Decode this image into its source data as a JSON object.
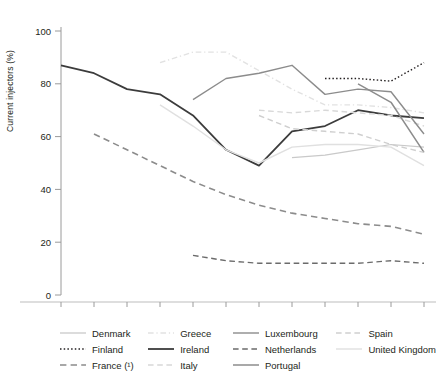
{
  "chart_data": {
    "type": "line",
    "title": "",
    "xlabel": "",
    "ylabel": "Current injectors (%)",
    "x": [
      1990,
      1991,
      1992,
      1993,
      1994,
      1995,
      1996,
      1997,
      1998,
      1999,
      2000,
      2001
    ],
    "xticklabels": [
      "1990",
      "1991",
      "1992",
      "1993",
      "1994",
      "1995",
      "1996",
      "1997",
      "1998",
      "1999",
      "2000",
      "2001"
    ],
    "yticks": [
      0,
      20,
      40,
      60,
      80,
      100
    ],
    "yticklabels": [
      "0",
      "20",
      "40",
      "60",
      "80",
      "100"
    ],
    "ylim": [
      0,
      100
    ],
    "xlim": [
      1990,
      2001
    ],
    "grid": false,
    "legend_position": "bottom",
    "series": [
      {
        "name": "Denmark",
        "color": "#c9c9c9",
        "dash": "solid",
        "width": 1.2,
        "x": [
          1997,
          1998,
          1999,
          2000,
          2001
        ],
        "values": [
          52,
          53,
          55,
          57,
          56
        ]
      },
      {
        "name": "Finland",
        "color": "#231f20",
        "dash": "dotted",
        "width": 1.4,
        "x": [
          1998,
          1999,
          2000,
          2001
        ],
        "values": [
          82,
          82,
          81,
          88
        ]
      },
      {
        "name": "France (¹)",
        "color": "#8c8c8c",
        "dash": "dashed",
        "width": 1.6,
        "x": [
          1991,
          1992,
          1993,
          1994,
          1995,
          1996,
          1997,
          1998,
          1999,
          2000,
          2001
        ],
        "values": [
          61,
          55,
          49,
          43,
          38,
          34,
          31,
          29,
          27,
          26,
          23
        ]
      },
      {
        "name": "Greece",
        "color": "#e2e2e2",
        "dash": "dashdot",
        "width": 1.4,
        "x": [
          1993,
          1994,
          1995,
          1996,
          1997,
          1998,
          1999,
          2000,
          2001
        ],
        "values": [
          88,
          92,
          92,
          85,
          78,
          72,
          72,
          71,
          69
        ]
      },
      {
        "name": "Ireland",
        "color": "#3c3c3c",
        "dash": "solid",
        "width": 1.8,
        "x": [
          1990,
          1991,
          1992,
          1993,
          1994,
          1995,
          1996,
          1997,
          1998,
          1999,
          2000,
          2001
        ],
        "values": [
          87,
          84,
          78,
          76,
          68,
          55,
          49,
          62,
          64,
          70,
          68,
          67
        ]
      },
      {
        "name": "Italy",
        "color": "#d8d8d8",
        "dash": "dashed",
        "width": 1.4,
        "x": [
          1996,
          1997,
          1998,
          1999,
          2000,
          2001
        ],
        "values": [
          70,
          69,
          70,
          69,
          68,
          64
        ]
      },
      {
        "name": "Luxembourg",
        "color": "#8c8c8c",
        "dash": "solid",
        "width": 1.4,
        "x": [
          1994,
          1995,
          1996,
          1997,
          1998,
          1999,
          2000,
          2001
        ],
        "values": [
          74,
          82,
          84,
          87,
          76,
          78,
          77,
          61
        ]
      },
      {
        "name": "Netherlands",
        "color": "#6b6b6b",
        "dash": "dashed",
        "width": 1.4,
        "x": [
          1994,
          1995,
          1996,
          1997,
          1998,
          1999,
          2000,
          2001
        ],
        "values": [
          15,
          13,
          12,
          12,
          12,
          12,
          13,
          12
        ]
      },
      {
        "name": "Portugal",
        "color": "#8c8c8c",
        "dash": "solid",
        "width": 1.5,
        "x": [
          1999,
          2000,
          2001
        ],
        "values": [
          80,
          73,
          54
        ]
      },
      {
        "name": "Spain",
        "color": "#cfcfcf",
        "dash": "dashed",
        "width": 1.4,
        "x": [
          1996,
          1997,
          1998,
          1999,
          2000,
          2001
        ],
        "values": [
          68,
          63,
          62,
          61,
          57,
          54
        ]
      },
      {
        "name": "United Kingdom",
        "color": "#e0e0e0",
        "dash": "solid",
        "width": 1.4,
        "x": [
          1993,
          1994,
          1995,
          1996,
          1997,
          1998,
          1999,
          2000,
          2001
        ],
        "values": [
          72,
          64,
          55,
          50,
          56,
          57,
          57,
          56,
          49
        ]
      }
    ]
  },
  "legend": {
    "columns": [
      [
        "Denmark",
        "Finland",
        "France (¹)"
      ],
      [
        "Greece",
        "Ireland",
        "Italy"
      ],
      [
        "Luxembourg",
        "Netherlands",
        "Portugal"
      ],
      [
        "Spain",
        "United Kingdom"
      ]
    ]
  },
  "footnote": ""
}
